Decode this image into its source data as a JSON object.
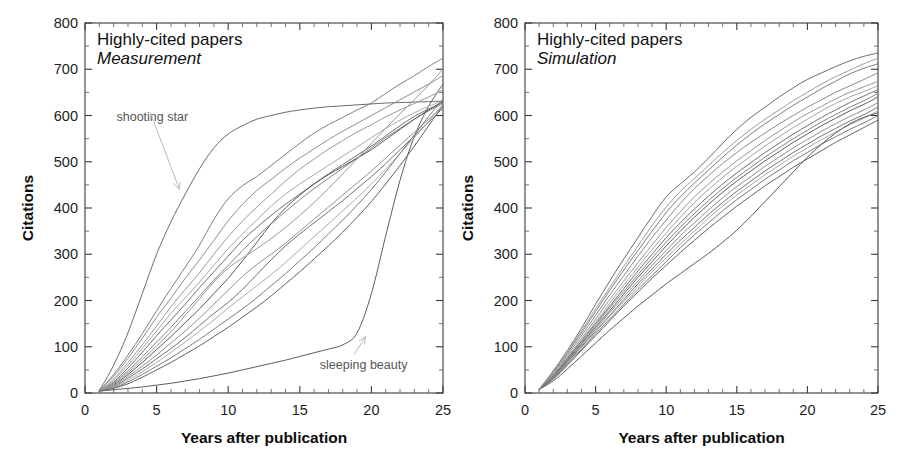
{
  "figure": {
    "width": 898,
    "height": 469,
    "background": "#ffffff"
  },
  "chart_data": [
    {
      "type": "line",
      "panel": "left",
      "title": "Highly-cited papers",
      "subtitle": "Measurement",
      "xlabel": "Years after publication",
      "ylabel": "Citations",
      "xlim": [
        0,
        25
      ],
      "ylim": [
        0,
        800
      ],
      "xticks": [
        0,
        5,
        10,
        15,
        20,
        25
      ],
      "yticks": [
        0,
        100,
        200,
        300,
        400,
        500,
        600,
        700,
        800
      ],
      "x_minor_step": 1,
      "y_minor_step": 50,
      "grid": false,
      "legend": "none",
      "x": [
        1,
        2,
        3,
        4,
        5,
        6,
        7,
        8,
        9,
        10,
        11,
        12,
        13,
        14,
        15,
        16,
        17,
        18,
        19,
        20,
        21,
        22,
        23,
        24,
        25
      ],
      "annotations": [
        {
          "label": "shooting star",
          "text_x": 2.2,
          "text_y": 588,
          "point_x": 6.6,
          "point_y": 440
        },
        {
          "label": "sleeping beauty",
          "text_x": 16.4,
          "text_y": 52,
          "point_x": 19.6,
          "point_y": 122
        }
      ],
      "series": [
        {
          "name": "shooting star",
          "color": "#6b6b6b",
          "values": [
            5,
            60,
            130,
            215,
            300,
            370,
            430,
            485,
            530,
            560,
            578,
            592,
            600,
            607,
            612,
            616,
            619,
            621,
            623,
            625,
            627,
            628,
            629,
            630,
            631
          ]
        },
        {
          "name": "sleeping beauty",
          "color": "#5d5d5d",
          "values": [
            4,
            7,
            10,
            13,
            17,
            21,
            26,
            31,
            37,
            43,
            50,
            57,
            64,
            71,
            79,
            87,
            95,
            104,
            130,
            215,
            340,
            460,
            555,
            620,
            668
          ]
        },
        {
          "name": "curve-03",
          "color": "#7e7e7e",
          "values": [
            5,
            40,
            82,
            128,
            178,
            226,
            272,
            320,
            375,
            420,
            448,
            468,
            492,
            516,
            540,
            562,
            580,
            596,
            612,
            627,
            648,
            668,
            686,
            706,
            724
          ]
        },
        {
          "name": "curve-04",
          "color": "#8c8c8c",
          "values": [
            5,
            36,
            75,
            118,
            164,
            205,
            248,
            288,
            330,
            372,
            408,
            438,
            462,
            486,
            508,
            528,
            548,
            566,
            583,
            600,
            617,
            634,
            651,
            668,
            686
          ]
        },
        {
          "name": "curve-05",
          "color": "#999999",
          "values": [
            4,
            30,
            66,
            104,
            145,
            186,
            224,
            260,
            300,
            338,
            372,
            402,
            430,
            458,
            484,
            506,
            527,
            546,
            564,
            580,
            597,
            612,
            626,
            640,
            655
          ]
        },
        {
          "name": "curve-06",
          "color": "#a8a8a8",
          "values": [
            5,
            28,
            60,
            96,
            134,
            172,
            206,
            240,
            276,
            312,
            344,
            374,
            404,
            430,
            452,
            472,
            492,
            512,
            532,
            552,
            572,
            590,
            606,
            620,
            632
          ]
        },
        {
          "name": "curve-07",
          "color": "#6f6f6f",
          "values": [
            4,
            24,
            54,
            88,
            124,
            158,
            192,
            228,
            262,
            296,
            330,
            358,
            384,
            408,
            430,
            452,
            474,
            494,
            514,
            534,
            556,
            578,
            598,
            614,
            628
          ]
        },
        {
          "name": "curve-08",
          "color": "#848484",
          "values": [
            5,
            22,
            48,
            78,
            110,
            142,
            176,
            210,
            244,
            276,
            308,
            338,
            366,
            392,
            418,
            442,
            464,
            486,
            508,
            530,
            552,
            572,
            592,
            610,
            626
          ]
        },
        {
          "name": "curve-09",
          "color": "#5a5a5a",
          "values": [
            4,
            18,
            40,
            66,
            94,
            122,
            152,
            182,
            215,
            248,
            286,
            326,
            366,
            400,
            428,
            452,
            472,
            490,
            508,
            526,
            548,
            570,
            592,
            612,
            630
          ]
        },
        {
          "name": "curve-10",
          "color": "#919191",
          "values": [
            5,
            16,
            36,
            58,
            82,
            108,
            134,
            162,
            192,
            222,
            252,
            278,
            300,
            324,
            350,
            376,
            402,
            428,
            454,
            480,
            508,
            536,
            564,
            592,
            620
          ]
        },
        {
          "name": "curve-11",
          "color": "#707070",
          "values": [
            4,
            14,
            32,
            52,
            74,
            96,
            120,
            146,
            172,
            196,
            224,
            256,
            288,
            318,
            344,
            368,
            392,
            416,
            442,
            468,
            496,
            526,
            556,
            586,
            616
          ]
        },
        {
          "name": "curve-12",
          "color": "#aaaaaa",
          "values": [
            5,
            13,
            28,
            46,
            66,
            88,
            110,
            134,
            158,
            184,
            208,
            232,
            256,
            282,
            310,
            338,
            366,
            394,
            422,
            452,
            484,
            518,
            552,
            588,
            624
          ]
        },
        {
          "name": "curve-13",
          "color": "#7a7a7a",
          "values": [
            4,
            11,
            24,
            40,
            58,
            76,
            96,
            116,
            138,
            160,
            182,
            206,
            232,
            258,
            286,
            314,
            344,
            374,
            406,
            440,
            478,
            518,
            558,
            598,
            636
          ]
        },
        {
          "name": "curve-14",
          "color": "#606060",
          "values": [
            4,
            10,
            20,
            34,
            50,
            66,
            84,
            102,
            122,
            142,
            164,
            186,
            210,
            236,
            262,
            290,
            318,
            348,
            380,
            414,
            452,
            492,
            534,
            578,
            622
          ]
        },
        {
          "name": "curve-15",
          "color": "#999999",
          "values": [
            5,
            20,
            44,
            72,
            102,
            132,
            168,
            204,
            240,
            270,
            292,
            312,
            334,
            358,
            384,
            412,
            442,
            474,
            506,
            540,
            572,
            604,
            634,
            666,
            700
          ]
        }
      ]
    },
    {
      "type": "line",
      "panel": "right",
      "title": "Highly-cited papers",
      "subtitle": "Simulation",
      "xlabel": "Years after publication",
      "ylabel": "Citations",
      "xlim": [
        0,
        25
      ],
      "ylim": [
        0,
        800
      ],
      "xticks": [
        0,
        5,
        10,
        15,
        20,
        25
      ],
      "yticks": [
        0,
        100,
        200,
        300,
        400,
        500,
        600,
        700,
        800
      ],
      "x_minor_step": 1,
      "y_minor_step": 50,
      "grid": false,
      "legend": "none",
      "x": [
        1,
        2,
        3,
        4,
        5,
        6,
        7,
        8,
        9,
        10,
        11,
        12,
        13,
        14,
        15,
        16,
        17,
        18,
        19,
        20,
        21,
        22,
        23,
        24,
        25
      ],
      "annotations": [],
      "series": [
        {
          "name": "sim-01",
          "color": "#6b6b6b",
          "values": [
            8,
            48,
            92,
            140,
            192,
            242,
            290,
            336,
            382,
            424,
            452,
            478,
            508,
            540,
            570,
            596,
            618,
            640,
            660,
            678,
            692,
            706,
            718,
            728,
            735
          ]
        },
        {
          "name": "sim-02",
          "color": "#7d7d7d",
          "values": [
            8,
            44,
            86,
            130,
            176,
            222,
            266,
            308,
            350,
            390,
            424,
            454,
            482,
            510,
            536,
            560,
            582,
            602,
            622,
            640,
            658,
            674,
            690,
            702,
            712
          ]
        },
        {
          "name": "sim-03",
          "color": "#8a8a8a",
          "values": [
            8,
            42,
            82,
            124,
            168,
            212,
            254,
            296,
            336,
            374,
            410,
            442,
            470,
            496,
            520,
            542,
            562,
            582,
            600,
            618,
            634,
            650,
            664,
            678,
            692
          ]
        },
        {
          "name": "sim-04",
          "color": "#979797",
          "values": [
            8,
            40,
            78,
            118,
            160,
            202,
            242,
            282,
            320,
            358,
            392,
            424,
            452,
            478,
            502,
            524,
            546,
            566,
            586,
            604,
            620,
            636,
            650,
            662,
            674
          ]
        },
        {
          "name": "sim-05",
          "color": "#a4a4a4",
          "values": [
            8,
            38,
            76,
            114,
            154,
            194,
            234,
            272,
            310,
            346,
            380,
            412,
            440,
            466,
            490,
            512,
            534,
            554,
            574,
            592,
            610,
            626,
            640,
            652,
            664
          ]
        },
        {
          "name": "sim-06",
          "color": "#6e6e6e",
          "values": [
            8,
            37,
            74,
            112,
            150,
            188,
            226,
            264,
            300,
            336,
            368,
            398,
            426,
            452,
            476,
            498,
            520,
            540,
            560,
            578,
            596,
            612,
            628,
            642,
            656
          ]
        },
        {
          "name": "sim-07",
          "color": "#828282",
          "values": [
            8,
            36,
            72,
            108,
            146,
            184,
            220,
            256,
            292,
            326,
            358,
            388,
            416,
            442,
            466,
            488,
            510,
            530,
            550,
            568,
            586,
            602,
            618,
            632,
            648
          ]
        },
        {
          "name": "sim-08",
          "color": "#5c5c5c",
          "values": [
            8,
            35,
            70,
            106,
            142,
            178,
            214,
            250,
            284,
            318,
            350,
            380,
            408,
            434,
            458,
            480,
            502,
            522,
            542,
            560,
            578,
            594,
            610,
            624,
            640
          ]
        },
        {
          "name": "sim-09",
          "color": "#909090",
          "values": [
            8,
            34,
            68,
            102,
            138,
            174,
            208,
            242,
            276,
            308,
            340,
            368,
            396,
            422,
            446,
            468,
            490,
            510,
            530,
            548,
            566,
            582,
            598,
            612,
            628
          ]
        },
        {
          "name": "sim-10",
          "color": "#727272",
          "values": [
            8,
            33,
            66,
            100,
            134,
            168,
            202,
            236,
            268,
            300,
            330,
            358,
            386,
            412,
            436,
            458,
            480,
            500,
            520,
            538,
            556,
            572,
            588,
            602,
            618
          ]
        },
        {
          "name": "sim-11",
          "color": "#a8a8a8",
          "values": [
            8,
            32,
            64,
            98,
            132,
            166,
            198,
            230,
            262,
            292,
            322,
            350,
            378,
            404,
            428,
            450,
            472,
            492,
            512,
            530,
            548,
            564,
            580,
            594,
            610
          ]
        },
        {
          "name": "sim-12",
          "color": "#787878",
          "values": [
            8,
            31,
            62,
            94,
            128,
            160,
            192,
            224,
            254,
            284,
            314,
            342,
            368,
            394,
            418,
            440,
            462,
            482,
            502,
            520,
            538,
            554,
            570,
            584,
            600
          ]
        },
        {
          "name": "sim-13",
          "color": "#646464",
          "values": [
            8,
            30,
            60,
            92,
            124,
            156,
            188,
            218,
            248,
            276,
            304,
            330,
            356,
            380,
            404,
            426,
            448,
            468,
            488,
            506,
            524,
            542,
            558,
            574,
            590
          ]
        },
        {
          "name": "sim-14",
          "color": "#5a5a5a",
          "values": [
            8,
            26,
            52,
            80,
            108,
            136,
            162,
            188,
            212,
            236,
            258,
            280,
            302,
            326,
            352,
            382,
            414,
            446,
            478,
            510,
            538,
            562,
            582,
            596,
            606
          ]
        },
        {
          "name": "sim-15",
          "color": "#9c9c9c",
          "values": [
            8,
            46,
            90,
            134,
            182,
            228,
            274,
            318,
            362,
            402,
            436,
            464,
            492,
            520,
            546,
            570,
            592,
            612,
            632,
            650,
            668,
            684,
            698,
            712,
            724
          ]
        }
      ]
    }
  ],
  "panels": {
    "left": {
      "plot_box": {
        "x": 85,
        "y": 23,
        "w": 358,
        "h": 370
      },
      "title_pos": {
        "x": 97,
        "y": 45
      },
      "subtitle_pos": {
        "x": 97,
        "y": 64
      }
    },
    "right": {
      "plot_box": {
        "x": 76,
        "y": 23,
        "w": 353,
        "h": 370
      },
      "title_pos": {
        "x": 88,
        "y": 45
      },
      "subtitle_pos": {
        "x": 88,
        "y": 64
      }
    }
  }
}
